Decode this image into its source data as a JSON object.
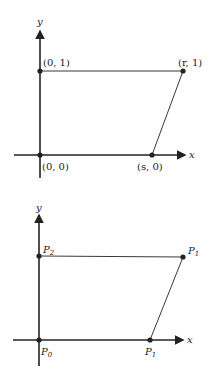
{
  "diagrams": [
    {
      "axes": {
        "x_label": "x",
        "y_label": "y"
      },
      "points": [
        {
          "id": "origin",
          "label": "(0, 0)"
        },
        {
          "id": "top-left",
          "label": "(0, 1)"
        },
        {
          "id": "top-right",
          "label": "(r, 1)"
        },
        {
          "id": "bottom-right",
          "label": "(s, 0)"
        }
      ]
    },
    {
      "axes": {
        "x_label": "x",
        "y_label": "y"
      },
      "points": [
        {
          "id": "origin",
          "label": "P",
          "sub": "0"
        },
        {
          "id": "top-left",
          "label": "P",
          "sub": "2"
        },
        {
          "id": "top-right",
          "label": "P",
          "sub": "1"
        },
        {
          "id": "bottom-right",
          "label": "P",
          "sub": "1"
        }
      ]
    }
  ],
  "colors": {
    "line": "#222222",
    "background": "#ffffff"
  }
}
